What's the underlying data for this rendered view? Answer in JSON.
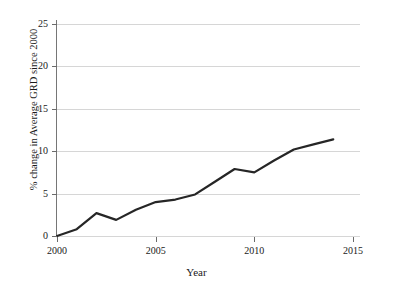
{
  "chart_data": {
    "type": "line",
    "title": "",
    "xlabel": "Year",
    "ylabel": "% change in Average GRD since 2000",
    "xlim": [
      2000,
      2015
    ],
    "ylim": [
      0,
      25
    ],
    "xticks": [
      2000,
      2005,
      2010,
      2015
    ],
    "xtick_labels": [
      "2000",
      "2005",
      "2010",
      "2015"
    ],
    "yticks": [
      0,
      5,
      10,
      15,
      20,
      25
    ],
    "ytick_labels": [
      "0",
      "5",
      "10",
      "15",
      "20",
      "25"
    ],
    "grid": "horizontal",
    "legend": "none",
    "series": [
      {
        "name": "% change in Average GRD since 2000",
        "color": "#262626",
        "line_width": 2.2,
        "x": [
          2000,
          2001,
          2002,
          2003,
          2004,
          2005,
          2006,
          2007,
          2008,
          2009,
          2010,
          2011,
          2012,
          2013,
          2014
        ],
        "values": [
          0.0,
          0.8,
          2.7,
          1.9,
          3.1,
          4.0,
          4.3,
          4.9,
          6.4,
          7.9,
          7.5,
          8.9,
          10.2,
          10.8,
          11.4
        ]
      }
    ]
  },
  "axes": {
    "x_title": "Year",
    "y_title": "% change in Average GRD since 2000"
  },
  "colors": {
    "line": "#262626",
    "grid": "#d6d6d6",
    "axis": "#767676",
    "background": "#ffffff",
    "text": "#1a1a1a"
  }
}
